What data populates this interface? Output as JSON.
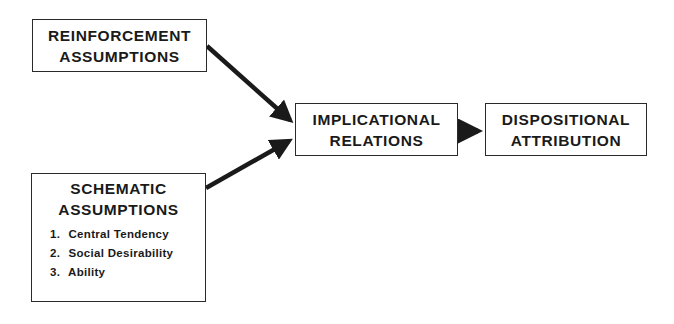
{
  "diagram": {
    "nodes": {
      "reinforcement": {
        "lines": [
          "REINFORCEMENT",
          "ASSUMPTIONS"
        ]
      },
      "schematic": {
        "lines": [
          "SCHEMATIC",
          "ASSUMPTIONS"
        ],
        "items": [
          {
            "num": "1.",
            "label": "Central Tendency"
          },
          {
            "num": "2.",
            "label": "Social Desirability"
          },
          {
            "num": "3.",
            "label": "Ability"
          }
        ]
      },
      "implicational": {
        "lines": [
          "IMPLICATIONAL",
          "RELATIONS"
        ]
      },
      "dispositional": {
        "lines": [
          "DISPOSITIONAL",
          "ATTRIBUTION"
        ]
      }
    },
    "edges": [
      {
        "from": "reinforcement",
        "to": "implicational"
      },
      {
        "from": "schematic",
        "to": "implicational"
      },
      {
        "from": "implicational",
        "to": "dispositional"
      }
    ],
    "colors": {
      "stroke": "#1a1a1a",
      "background": "#ffffff"
    }
  }
}
